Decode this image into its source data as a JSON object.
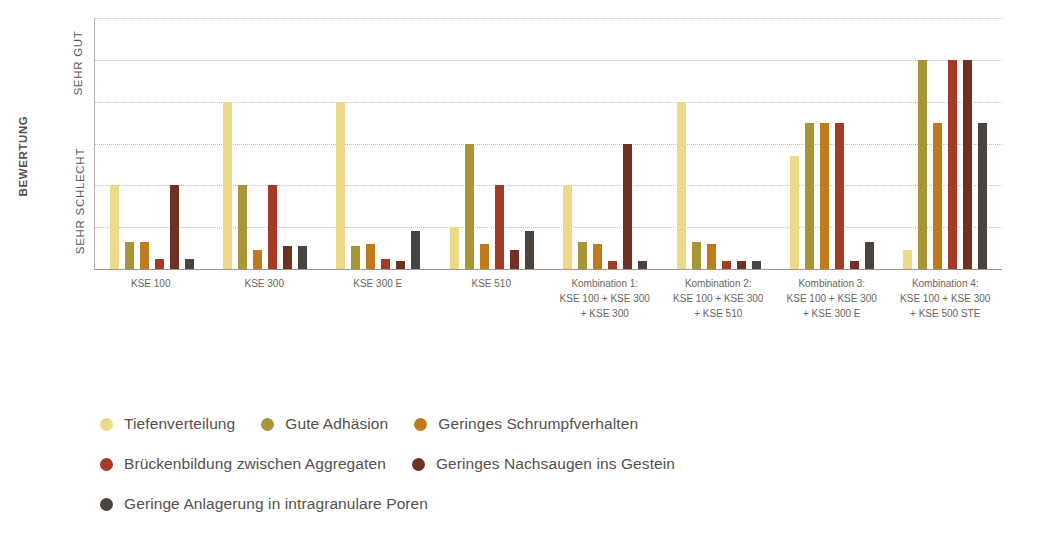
{
  "chart_data": {
    "type": "bar",
    "title": "",
    "subtitle": "",
    "xlabel": "",
    "ylabel": "BEWERTUNG",
    "ylim": [
      0,
      6
    ],
    "grid": true,
    "gridline_values": [
      1,
      2,
      3,
      4,
      5,
      6
    ],
    "legend_position": "bottom-left",
    "y_tick_labels": [
      "SEHR SCHLECHT",
      "SEHR GUT"
    ],
    "categories": [
      "KSE 100",
      "KSE 300",
      "KSE 300 E",
      "KSE 510",
      "Kombination 1: KSE 100 + KSE 300 + KSE 300",
      "Kombination 2: KSE 100 + KSE 300 + KSE 510",
      "Kombination 3: KSE 100 + KSE 300 + KSE 300 E",
      "Kombination 4: KSE 100 + KSE 300 + KSE 500 STE"
    ],
    "series": [
      {
        "name": "Tiefenverteilung",
        "color": "#ecd98a",
        "values": [
          2.0,
          4.0,
          4.0,
          1.0,
          2.0,
          4.0,
          2.7,
          0.45
        ]
      },
      {
        "name": "Gute Adhäsion",
        "color": "#a89538",
        "values": [
          0.65,
          2.0,
          0.55,
          3.0,
          0.65,
          0.65,
          3.5,
          5.0
        ]
      },
      {
        "name": "Geringes Schrumpfverhalten",
        "color": "#c07a1e",
        "values": [
          0.65,
          0.45,
          0.6,
          0.6,
          0.6,
          0.6,
          3.5,
          3.5
        ]
      },
      {
        "name": "Brückenbildung zwischen Aggregaten",
        "color": "#a53a27",
        "values": [
          0.25,
          2.0,
          0.25,
          2.0,
          0.2,
          0.2,
          3.5,
          5.0
        ]
      },
      {
        "name": "Geringes Nachsaugen ins Gestein",
        "color": "#6e3122",
        "values": [
          2.0,
          0.55,
          0.2,
          0.45,
          3.0,
          0.2,
          0.2,
          5.0
        ]
      },
      {
        "name": "Geringe Anlagerung in intragranulare Poren",
        "color": "#4a4440",
        "values": [
          0.25,
          0.55,
          0.9,
          0.9,
          0.2,
          0.2,
          0.65,
          3.5
        ]
      }
    ]
  },
  "axis": {
    "y_title": "BEWERTUNG",
    "y_top_label": "SEHR GUT",
    "y_bottom_label": "SEHR SCHLECHT"
  },
  "xticks": [
    {
      "lines": [
        "KSE 100"
      ]
    },
    {
      "lines": [
        "KSE 300"
      ]
    },
    {
      "lines": [
        "KSE 300 E"
      ]
    },
    {
      "lines": [
        "KSE 510"
      ]
    },
    {
      "lines": [
        "Kombination 1:",
        "KSE 100 + KSE 300",
        "+ KSE 300"
      ]
    },
    {
      "lines": [
        "Kombination 2:",
        "KSE 100 + KSE 300",
        "+ KSE 510"
      ]
    },
    {
      "lines": [
        "Kombination 3:",
        "KSE 100 + KSE 300",
        "+ KSE 300 E"
      ]
    },
    {
      "lines": [
        "Kombination 4:",
        "KSE 100 + KSE 300",
        "+ KSE 500 STE"
      ]
    }
  ],
  "legend": {
    "rows": [
      [
        {
          "label": "Tiefenverteilung",
          "color": "#ecd98a"
        },
        {
          "label": "Gute Adhäsion",
          "color": "#a89538"
        },
        {
          "label": "Geringes Schrumpfverhalten",
          "color": "#c07a1e"
        }
      ],
      [
        {
          "label": "Brückenbildung zwischen Aggregaten",
          "color": "#a53a27"
        },
        {
          "label": "Geringes Nachsaugen ins Gestein",
          "color": "#6e3122"
        }
      ],
      [
        {
          "label": "Geringe Anlagerung in intragranulare Poren",
          "color": "#4a4440"
        }
      ]
    ]
  },
  "colors": {
    "gridline": "#a9b7c6",
    "axis": "#9c9792",
    "text": "#55504c"
  }
}
